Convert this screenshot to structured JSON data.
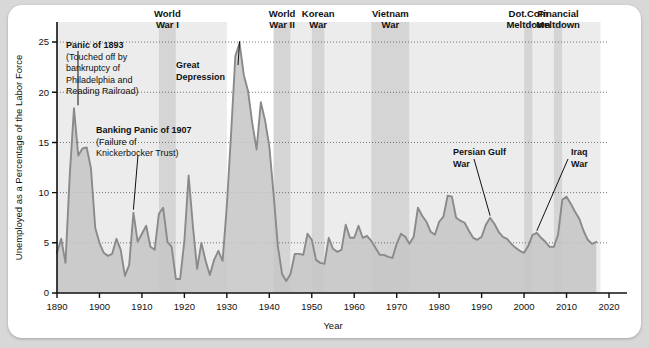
{
  "figure": {
    "background_color": "#ffffff",
    "page_background_color": "#d8d8d8"
  },
  "chart_data": {
    "type": "area",
    "title": "",
    "xlabel": "Year",
    "ylabel": "Unemployed as a Percentage of the Labor Force",
    "xlim": [
      1890,
      2020
    ],
    "ylim": [
      0,
      27
    ],
    "xticks": [
      1890,
      1900,
      1910,
      1920,
      1930,
      1940,
      1950,
      1960,
      1970,
      1980,
      1990,
      2000,
      2010,
      2020
    ],
    "yticks": [
      0,
      5,
      10,
      15,
      20,
      25
    ],
    "grid": "horizontal-dotted",
    "legend": "none",
    "line_color": "#8a8a8a",
    "fill_color": "#c6c6c6",
    "series": [
      {
        "name": "Unemployment rate",
        "x": [
          1890,
          1891,
          1892,
          1893,
          1894,
          1895,
          1896,
          1897,
          1898,
          1899,
          1900,
          1901,
          1902,
          1903,
          1904,
          1905,
          1906,
          1907,
          1908,
          1909,
          1910,
          1911,
          1912,
          1913,
          1914,
          1915,
          1916,
          1917,
          1918,
          1919,
          1920,
          1921,
          1922,
          1923,
          1924,
          1925,
          1926,
          1927,
          1928,
          1929,
          1930,
          1931,
          1932,
          1933,
          1934,
          1935,
          1936,
          1937,
          1938,
          1939,
          1940,
          1941,
          1942,
          1943,
          1944,
          1945,
          1946,
          1947,
          1948,
          1949,
          1950,
          1951,
          1952,
          1953,
          1954,
          1955,
          1956,
          1957,
          1958,
          1959,
          1960,
          1961,
          1962,
          1963,
          1964,
          1965,
          1966,
          1967,
          1968,
          1969,
          1970,
          1971,
          1972,
          1973,
          1974,
          1975,
          1976,
          1977,
          1978,
          1979,
          1980,
          1981,
          1982,
          1983,
          1984,
          1985,
          1986,
          1987,
          1988,
          1989,
          1990,
          1991,
          1992,
          1993,
          1994,
          1995,
          1996,
          1997,
          1998,
          1999,
          2000,
          2001,
          2002,
          2003,
          2004,
          2005,
          2006,
          2007,
          2008,
          2009,
          2010,
          2011,
          2012,
          2013,
          2014,
          2015,
          2016,
          2017
        ],
        "values": [
          4.0,
          5.4,
          3.0,
          11.7,
          18.4,
          13.7,
          14.4,
          14.5,
          12.4,
          6.5,
          5.0,
          4.0,
          3.7,
          3.9,
          5.4,
          4.3,
          1.7,
          2.8,
          8.0,
          5.1,
          5.9,
          6.7,
          4.6,
          4.3,
          7.9,
          8.5,
          5.1,
          4.6,
          1.4,
          1.4,
          5.2,
          11.7,
          6.7,
          2.4,
          5.0,
          3.2,
          1.8,
          3.3,
          4.2,
          3.2,
          8.7,
          15.9,
          23.6,
          24.9,
          21.7,
          20.1,
          16.9,
          14.3,
          19.0,
          17.2,
          14.6,
          9.9,
          4.7,
          1.9,
          1.2,
          1.9,
          3.9,
          3.9,
          3.8,
          5.9,
          5.3,
          3.3,
          3.0,
          2.9,
          5.5,
          4.4,
          4.1,
          4.3,
          6.8,
          5.5,
          5.5,
          6.7,
          5.5,
          5.7,
          5.2,
          4.5,
          3.8,
          3.8,
          3.6,
          3.5,
          4.9,
          5.9,
          5.6,
          4.9,
          5.6,
          8.5,
          7.7,
          7.1,
          6.1,
          5.8,
          7.1,
          7.6,
          9.7,
          9.6,
          7.5,
          7.2,
          7.0,
          6.2,
          5.5,
          5.3,
          5.6,
          6.8,
          7.5,
          6.9,
          6.1,
          5.6,
          5.4,
          4.9,
          4.5,
          4.2,
          4.0,
          4.7,
          5.8,
          6.0,
          5.5,
          5.1,
          4.6,
          4.6,
          5.8,
          9.3,
          9.6,
          8.9,
          8.1,
          7.4,
          6.2,
          5.3,
          4.9,
          5.1
        ]
      }
    ],
    "shaded_bands": [
      {
        "label": "World\nWar I",
        "label_line1": "World",
        "label_line2": "War I",
        "start": 1914,
        "end": 1918
      },
      {
        "label": "World\nWar II",
        "label_line1": "World",
        "label_line2": "War II",
        "start": 1941,
        "end": 1945
      },
      {
        "label": "Korean\nWar",
        "label_line1": "Korean",
        "label_line2": "War",
        "start": 1950,
        "end": 1953
      },
      {
        "label": "Vietnam\nWar",
        "label_line1": "Vietnam",
        "label_line2": "War",
        "start": 1964,
        "end": 1973
      },
      {
        "label": "Dot.Com\nMeltdown",
        "label_line1": "Dot.Com",
        "label_line2": "Meltdown",
        "start": 2000,
        "end": 2002
      },
      {
        "label": "Financial\nMeltdown",
        "label_line1": "Financial",
        "label_line2": "Meltdown",
        "start": 2007,
        "end": 2009
      }
    ],
    "extra_shaded_bands": [
      {
        "start": 1890,
        "end": 1914
      },
      {
        "start": 1918,
        "end": 1930
      },
      {
        "start": 1945,
        "end": 1950
      },
      {
        "start": 1953,
        "end": 1964
      },
      {
        "start": 1973,
        "end": 2000
      },
      {
        "start": 2002,
        "end": 2007
      },
      {
        "start": 2009,
        "end": 2018
      }
    ],
    "annotations": [
      {
        "name": "panic-1893",
        "lines": [
          "Panic of 1893",
          "(Touched off by",
          "bankruptcy of",
          "Philadelphia and",
          "Reading Railroad)"
        ],
        "bold_first_line": true,
        "points_to_year": 1894,
        "points_to_value": 18.4
      },
      {
        "name": "banking-panic-1907",
        "lines": [
          "Banking Panic of 1907",
          "(Failure of",
          "Knickerbocker Trust)"
        ],
        "bold_first_line": true,
        "points_to_year": 1908,
        "points_to_value": 8.0
      },
      {
        "name": "great-depression",
        "lines": [
          "Great",
          "Depression"
        ],
        "bold_first_line": true,
        "bold_all": true,
        "points_to_year": 1933,
        "points_to_value": 24.9
      },
      {
        "name": "persian-gulf-war",
        "lines": [
          "Persian Gulf",
          "War"
        ],
        "bold_all": true,
        "points_to_year": 1992,
        "points_to_value": 7.5
      },
      {
        "name": "iraq-war",
        "lines": [
          "Iraq",
          "War"
        ],
        "bold_all": true,
        "points_to_year": 2003,
        "points_to_value": 6.0
      }
    ]
  }
}
